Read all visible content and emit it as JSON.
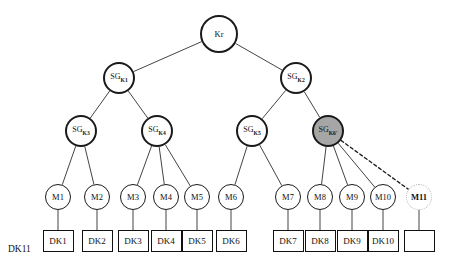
{
  "diagram": {
    "legend_label": "DK11",
    "colors": {
      "stroke": "#111111",
      "shaded_fill": "#a6a6a6",
      "ghost_stroke": "#b9b9b9",
      "background": "#ffffff"
    },
    "nodes": [
      {
        "id": "Kr",
        "label": "Kr",
        "sub": "",
        "shape": "circle",
        "style": "root",
        "x": 219,
        "y": 34,
        "r": 19
      },
      {
        "id": "SGK1",
        "label": "SG",
        "sub": "K1",
        "shape": "circle",
        "style": "sg",
        "x": 119,
        "y": 78,
        "r": 16
      },
      {
        "id": "SGK2",
        "label": "SG",
        "sub": "K2",
        "shape": "circle",
        "style": "sg",
        "x": 296,
        "y": 78,
        "r": 16
      },
      {
        "id": "SGK3",
        "label": "SG",
        "sub": "K3",
        "shape": "circle",
        "style": "sg",
        "x": 81,
        "y": 131,
        "r": 16
      },
      {
        "id": "SGK4",
        "label": "SG",
        "sub": "K4",
        "shape": "circle",
        "style": "sg",
        "x": 157,
        "y": 131,
        "r": 16
      },
      {
        "id": "SGK5",
        "label": "SG",
        "sub": "K5",
        "shape": "circle",
        "style": "sg",
        "x": 252,
        "y": 131,
        "r": 16
      },
      {
        "id": "SGK6",
        "label": "SG",
        "sub": "K6'",
        "shape": "circle",
        "style": "shaded",
        "x": 328,
        "y": 131,
        "r": 16
      },
      {
        "id": "M1",
        "label": "M1",
        "sub": "",
        "shape": "circle",
        "style": "m",
        "x": 58,
        "y": 197,
        "r": 13
      },
      {
        "id": "M2",
        "label": "M2",
        "sub": "",
        "shape": "circle",
        "style": "m",
        "x": 97,
        "y": 197,
        "r": 13
      },
      {
        "id": "M3",
        "label": "M3",
        "sub": "",
        "shape": "circle",
        "style": "m",
        "x": 133,
        "y": 197,
        "r": 13
      },
      {
        "id": "M4",
        "label": "M4",
        "sub": "",
        "shape": "circle",
        "style": "m",
        "x": 166,
        "y": 197,
        "r": 13
      },
      {
        "id": "M5",
        "label": "M5",
        "sub": "",
        "shape": "circle",
        "style": "m",
        "x": 197,
        "y": 197,
        "r": 13
      },
      {
        "id": "M6",
        "label": "M6",
        "sub": "",
        "shape": "circle",
        "style": "m",
        "x": 231,
        "y": 197,
        "r": 13
      },
      {
        "id": "M7",
        "label": "M7",
        "sub": "",
        "shape": "circle",
        "style": "m",
        "x": 288,
        "y": 197,
        "r": 13
      },
      {
        "id": "M8",
        "label": "M8",
        "sub": "",
        "shape": "circle",
        "style": "m",
        "x": 320,
        "y": 197,
        "r": 13
      },
      {
        "id": "M9",
        "label": "M9",
        "sub": "",
        "shape": "circle",
        "style": "m",
        "x": 352,
        "y": 197,
        "r": 13
      },
      {
        "id": "M10",
        "label": "M10",
        "sub": "",
        "shape": "circle",
        "style": "m",
        "x": 383,
        "y": 197,
        "r": 13
      },
      {
        "id": "M11",
        "label": "M11",
        "sub": "",
        "shape": "circle",
        "style": "ghost",
        "x": 419,
        "y": 197,
        "r": 13
      }
    ],
    "boxes": [
      {
        "id": "DK1",
        "label": "DK1",
        "x": 58,
        "y": 241,
        "w": 31,
        "h": 22
      },
      {
        "id": "DK2",
        "label": "DK2",
        "x": 97,
        "y": 241,
        "w": 31,
        "h": 22
      },
      {
        "id": "DK3",
        "label": "DK3",
        "x": 133,
        "y": 241,
        "w": 31,
        "h": 22
      },
      {
        "id": "DK4",
        "label": "DK4",
        "x": 166,
        "y": 241,
        "w": 31,
        "h": 22
      },
      {
        "id": "DK5",
        "label": "DK5",
        "x": 197,
        "y": 241,
        "w": 31,
        "h": 22
      },
      {
        "id": "DK6",
        "label": "DK6",
        "x": 231,
        "y": 241,
        "w": 31,
        "h": 22
      },
      {
        "id": "DK7",
        "label": "DK7",
        "x": 288,
        "y": 241,
        "w": 31,
        "h": 22
      },
      {
        "id": "DK8",
        "label": "DK8",
        "x": 320,
        "y": 241,
        "w": 31,
        "h": 22
      },
      {
        "id": "DK9",
        "label": "DK9",
        "x": 352,
        "y": 241,
        "w": 31,
        "h": 22
      },
      {
        "id": "DK10",
        "label": "DK10",
        "x": 383,
        "y": 241,
        "w": 31,
        "h": 22
      },
      {
        "id": "DK11box",
        "label": "",
        "x": 419,
        "y": 241,
        "w": 31,
        "h": 22
      }
    ],
    "edges": [
      {
        "from": "Kr",
        "to": "SGK1",
        "style": "solid"
      },
      {
        "from": "Kr",
        "to": "SGK2",
        "style": "solid"
      },
      {
        "from": "SGK1",
        "to": "SGK3",
        "style": "solid"
      },
      {
        "from": "SGK1",
        "to": "SGK4",
        "style": "solid"
      },
      {
        "from": "SGK2",
        "to": "SGK5",
        "style": "solid"
      },
      {
        "from": "SGK2",
        "to": "SGK6",
        "style": "solid"
      },
      {
        "from": "SGK3",
        "to": "M1",
        "style": "solid"
      },
      {
        "from": "SGK3",
        "to": "M2",
        "style": "solid"
      },
      {
        "from": "SGK4",
        "to": "M3",
        "style": "solid"
      },
      {
        "from": "SGK4",
        "to": "M4",
        "style": "solid"
      },
      {
        "from": "SGK4",
        "to": "M5",
        "style": "solid"
      },
      {
        "from": "SGK5",
        "to": "M6",
        "style": "solid"
      },
      {
        "from": "SGK5",
        "to": "M7",
        "style": "solid"
      },
      {
        "from": "SGK6",
        "to": "M8",
        "style": "solid"
      },
      {
        "from": "SGK6",
        "to": "M9",
        "style": "solid"
      },
      {
        "from": "SGK6",
        "to": "M10",
        "style": "solid"
      },
      {
        "from": "SGK6",
        "to": "M11",
        "style": "dotted"
      },
      {
        "from": "M1",
        "to": "DK1",
        "style": "solid"
      },
      {
        "from": "M2",
        "to": "DK2",
        "style": "solid"
      },
      {
        "from": "M3",
        "to": "DK3",
        "style": "solid"
      },
      {
        "from": "M4",
        "to": "DK4",
        "style": "solid"
      },
      {
        "from": "M5",
        "to": "DK5",
        "style": "solid"
      },
      {
        "from": "M6",
        "to": "DK6",
        "style": "solid"
      },
      {
        "from": "M7",
        "to": "DK7",
        "style": "solid"
      },
      {
        "from": "M8",
        "to": "DK8",
        "style": "solid"
      },
      {
        "from": "M9",
        "to": "DK9",
        "style": "solid"
      },
      {
        "from": "M10",
        "to": "DK10",
        "style": "solid"
      },
      {
        "from": "M11",
        "to": "DK11box",
        "style": "solid"
      }
    ],
    "legend": {
      "x": 8,
      "y": 250,
      "label": "DK11"
    }
  }
}
